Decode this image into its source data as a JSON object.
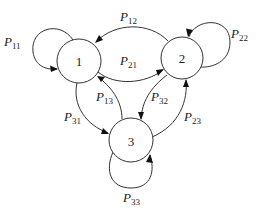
{
  "diagram": {
    "type": "markov-chain-state-diagram",
    "nodes": [
      {
        "id": "1",
        "label": "1"
      },
      {
        "id": "2",
        "label": "2"
      },
      {
        "id": "3",
        "label": "3"
      }
    ],
    "edges": [
      {
        "from": "1",
        "to": "1",
        "label": "P",
        "sub": "11"
      },
      {
        "from": "2",
        "to": "1",
        "label": "P",
        "sub": "12"
      },
      {
        "from": "1",
        "to": "2",
        "label": "P",
        "sub": "21"
      },
      {
        "from": "2",
        "to": "2",
        "label": "P",
        "sub": "22"
      },
      {
        "from": "3",
        "to": "1",
        "label": "P",
        "sub": "13"
      },
      {
        "from": "1",
        "to": "3",
        "label": "P",
        "sub": "31"
      },
      {
        "from": "2",
        "to": "3",
        "label": "P",
        "sub": "32"
      },
      {
        "from": "3",
        "to": "2",
        "label": "P",
        "sub": "23"
      },
      {
        "from": "3",
        "to": "3",
        "label": "P",
        "sub": "33"
      }
    ]
  }
}
